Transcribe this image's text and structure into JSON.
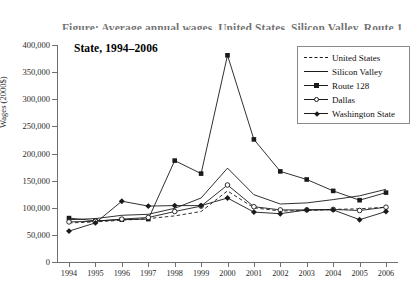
{
  "title": {
    "line1_clipped": "Figure: Average annual wages, United States, Silicon Valley, Route 128, Dallas, and Washington",
    "line2": "State, 1994–2006"
  },
  "axis": {
    "ylabel": "Wages (2000$)",
    "xlabel": "",
    "yticks": [
      "0",
      "50,000",
      "100,000",
      "150,000",
      "200,000",
      "250,000",
      "300,000",
      "350,000",
      "400,000"
    ],
    "xticks": [
      "1994",
      "1995",
      "1996",
      "1997",
      "1998",
      "1999",
      "2000",
      "2001",
      "2002",
      "2003",
      "2004",
      "2005",
      "2006"
    ]
  },
  "legend": {
    "position": "top-right",
    "items": [
      {
        "label": "United States",
        "style": "dashed",
        "marker": "none"
      },
      {
        "label": "Silicon Valley",
        "style": "solid",
        "marker": "none"
      },
      {
        "label": "Route 128",
        "style": "solid",
        "marker": "square"
      },
      {
        "label": "Dallas",
        "style": "solid",
        "marker": "circle"
      },
      {
        "label": "Washington State",
        "style": "solid",
        "marker": "diamond"
      }
    ]
  },
  "chart_data": {
    "type": "line",
    "title": "Average annual wages, United States, Silicon Valley, Route 128, Dallas, and Washington State, 1994–2006",
    "xlabel": "",
    "ylabel": "Wages (2000$)",
    "ylim": [
      0,
      400000
    ],
    "ytick_step": 50000,
    "grid": false,
    "legend_position": "top-right",
    "x": [
      1994,
      1995,
      1996,
      1997,
      1998,
      1999,
      2000,
      2001,
      2002,
      2003,
      2004,
      2005,
      2006
    ],
    "series": [
      {
        "name": "United States",
        "style": "dashed",
        "marker": "none",
        "color": "#1a1a1a",
        "values": [
          72000,
          74000,
          77000,
          80000,
          85000,
          93000,
          131000,
          100000,
          94000,
          95000,
          97000,
          98000,
          101000
        ]
      },
      {
        "name": "Silicon Valley",
        "style": "solid",
        "marker": "none",
        "color": "#1a1a1a",
        "values": [
          78000,
          80000,
          86000,
          88000,
          99000,
          118000,
          173000,
          124000,
          107000,
          109000,
          115000,
          122000,
          134000
        ]
      },
      {
        "name": "Route 128",
        "style": "solid",
        "marker": "square",
        "color": "#1a1a1a",
        "values": [
          81000,
          76000,
          78000,
          79000,
          187000,
          163000,
          381000,
          226000,
          167000,
          152000,
          131000,
          114000,
          128000
        ]
      },
      {
        "name": "Dallas",
        "style": "solid",
        "marker": "circle",
        "color": "#1a1a1a",
        "values": [
          74000,
          75000,
          79000,
          82000,
          93000,
          103000,
          142000,
          102000,
          96000,
          96000,
          97000,
          95000,
          101000
        ]
      },
      {
        "name": "Washington State",
        "style": "solid",
        "marker": "diamond",
        "color": "#1a1a1a",
        "values": [
          57000,
          72000,
          112000,
          103000,
          104000,
          104000,
          118000,
          92000,
          89000,
          96000,
          96000,
          78000,
          93000
        ]
      }
    ]
  }
}
